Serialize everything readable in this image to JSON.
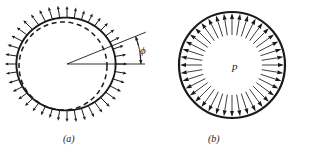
{
  "figure": {
    "title": "",
    "background_color": "#ffffff",
    "ink_color": "#1a1a1a",
    "width": 309,
    "height": 159,
    "panels": [
      {
        "id": "a",
        "caption": "(a)",
        "description": "deformed circular ring with non-uniform outward radial traction and dashed undeformed reference circle",
        "labels": [
          {
            "name": "phi",
            "text": "ϕ",
            "meaning": "angular coordinate"
          }
        ],
        "geometry": {
          "center_x": 67,
          "center_y": 64,
          "solid_radius": 48,
          "dashed_radius": 44,
          "dashed_offset_x": -4,
          "dashed_offset_y": 2,
          "arrow_count": 40,
          "arrow_direction": "outward",
          "angle_line_deg": -22,
          "baseline_deg": 0
        }
      },
      {
        "id": "b",
        "caption": "(b)",
        "description": "circular ring under uniform internal pressure with uniform outward radial arrows",
        "labels": [
          {
            "name": "pressure",
            "text": "p",
            "meaning": "uniform internal pressure"
          }
        ],
        "geometry": {
          "center_x": 232,
          "center_y": 65,
          "outer_radius": 53,
          "inner_radius": 30,
          "arrow_count": 40,
          "arrow_direction": "outward"
        }
      }
    ]
  }
}
